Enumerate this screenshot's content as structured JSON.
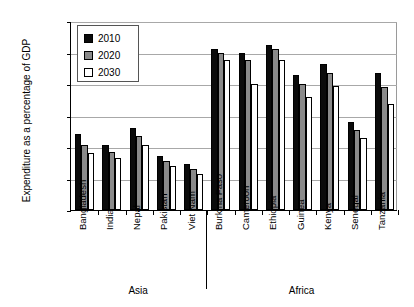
{
  "chart_data": {
    "type": "bar",
    "title": "",
    "xlabel": "",
    "ylabel": "Expenditure as a percentage of GDP",
    "ylim": [
      0,
      1.2
    ],
    "ytick_labels": [
      "0.0%",
      "0.2%",
      "0.4%",
      "0.6%",
      "0.8%",
      "1.0%",
      "1.2%"
    ],
    "ytick_values": [
      0,
      0.2,
      0.4,
      0.6,
      0.8,
      1.0,
      1.2
    ],
    "grid": true,
    "legend_position": "upper-left-inside",
    "categories": [
      "Bangladesh",
      "India",
      "Nepal",
      "Pakistan",
      "Viet Nam",
      "Burkina Faso",
      "Cameroon",
      "Ethiopia",
      "Guinea",
      "Kenya",
      "Senegal",
      "Tanzania"
    ],
    "series": [
      {
        "name": "2010",
        "color": "#0b0b0b",
        "values": [
          0.48,
          0.41,
          0.52,
          0.34,
          0.29,
          1.02,
          1.0,
          1.05,
          0.86,
          0.93,
          0.56,
          0.87
        ]
      },
      {
        "name": "2020",
        "color": "#8a8a8a",
        "values": [
          0.41,
          0.37,
          0.47,
          0.31,
          0.26,
          1.0,
          0.95,
          1.02,
          0.8,
          0.87,
          0.51,
          0.78
        ]
      },
      {
        "name": "2030",
        "color": "#ffffff",
        "values": [
          0.36,
          0.33,
          0.41,
          0.28,
          0.23,
          0.95,
          0.8,
          0.95,
          0.72,
          0.79,
          0.46,
          0.67
        ]
      }
    ],
    "groups": [
      {
        "label": "Asia",
        "start": 0,
        "end": 4
      },
      {
        "label": "Africa",
        "start": 5,
        "end": 11
      }
    ]
  }
}
